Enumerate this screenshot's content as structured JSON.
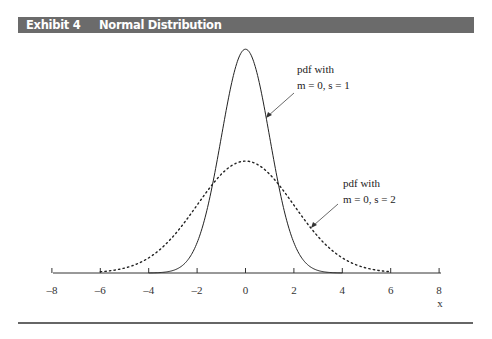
{
  "header": {
    "exhibit_number": "Exhibit 4",
    "title": "Normal Distribution",
    "bar_color": "#6b6b6b"
  },
  "chart_data": {
    "type": "line",
    "title": "Normal Distribution",
    "xlabel": "x",
    "ylabel": "",
    "xlim": [
      -8,
      8
    ],
    "x_ticks": [
      -8,
      -6,
      -4,
      -2,
      0,
      2,
      4,
      6,
      8
    ],
    "x_tick_labels": [
      "–8",
      "–6",
      "–4",
      "–2",
      "0",
      "2",
      "4",
      "6",
      "8"
    ],
    "grid": false,
    "legend": "none (inline annotations)",
    "series": [
      {
        "name": "pdf with m = 0, s = 1",
        "style": "solid",
        "mean": 0,
        "sd": 1,
        "x": [
          -4,
          -3,
          -2,
          -1.5,
          -1,
          -0.5,
          0,
          0.5,
          1,
          1.5,
          2,
          3,
          4
        ],
        "values": [
          0.0001,
          0.0044,
          0.054,
          0.1295,
          0.242,
          0.3521,
          0.3989,
          0.3521,
          0.242,
          0.1295,
          0.054,
          0.0044,
          0.0001
        ]
      },
      {
        "name": "pdf with m = 0, s = 2",
        "style": "dotted",
        "mean": 0,
        "sd": 2,
        "x": [
          -6,
          -5,
          -4,
          -3,
          -2,
          -1,
          0,
          1,
          2,
          3,
          4,
          5,
          6
        ],
        "values": [
          0.0022,
          0.0088,
          0.027,
          0.0648,
          0.121,
          0.176,
          0.1995,
          0.176,
          0.121,
          0.0648,
          0.027,
          0.0088,
          0.0022
        ]
      }
    ],
    "annotations": [
      {
        "line1": "pdf with",
        "line2": "m = 0, s = 1",
        "points_to": "solid curve"
      },
      {
        "line1": "pdf with",
        "line2": "m = 0, s = 2",
        "points_to": "dotted curve"
      }
    ]
  }
}
